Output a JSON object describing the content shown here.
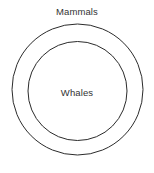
{
  "diagram": {
    "type": "euler-nested-sets",
    "background_color": "#ffffff",
    "stroke_color": "#2b2b2b",
    "stroke_width": 1,
    "text_color": "#333333",
    "canvas": {
      "width": 154,
      "height": 173
    },
    "sets": [
      {
        "id": "outer",
        "label": "Mammals",
        "role": "superset",
        "shape": "circle",
        "center_x": 77.5,
        "center_y": 89.5,
        "radius": 65.5,
        "fill": "none",
        "label_position": "above"
      },
      {
        "id": "inner",
        "label": "Whales",
        "role": "subset",
        "shape": "circle",
        "center_x": 77.5,
        "center_y": 91,
        "radius": 49.5,
        "fill": "none",
        "label_position": "inside"
      }
    ]
  }
}
